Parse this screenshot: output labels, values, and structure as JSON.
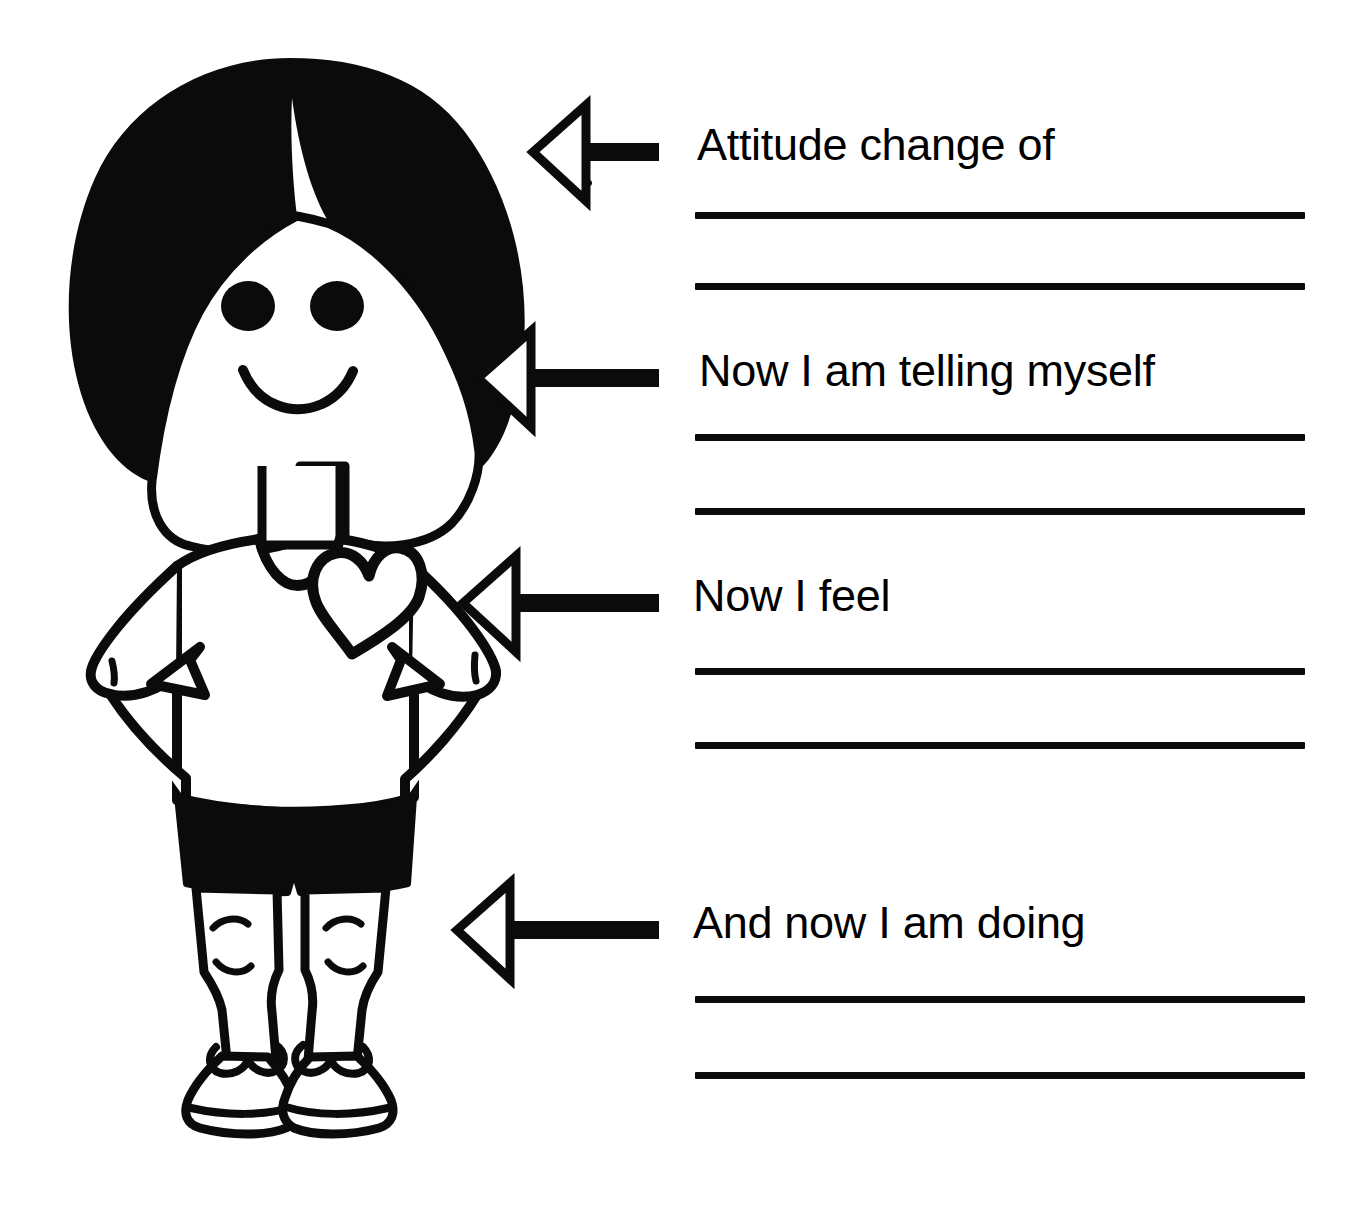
{
  "worksheet": {
    "title": "Attitude change worksheet",
    "background_color": "#ffffff",
    "ink_color": "#000000",
    "illustration": {
      "name": "cartoon-child-figure",
      "description": "Black and white line drawing of a smiling child with bobbed black hair, hands on hips, white t-shirt with an outlined heart, black shorts, bare legs and sneakers",
      "parts": [
        "hair",
        "face",
        "left-eye",
        "right-eye",
        "smile",
        "neck",
        "tshirt",
        "heart",
        "left-arm",
        "right-arm",
        "shorts",
        "left-leg",
        "right-leg",
        "left-shoe",
        "right-shoe"
      ]
    },
    "prompts": [
      {
        "id": "attitude-change",
        "label": "Attitude change of",
        "label_x": 697,
        "label_y": 122,
        "arrow": {
          "tip_x": 533,
          "tail_x": 659,
          "y": 152,
          "height": 98
        },
        "lines": [
          {
            "x": 695,
            "y": 212,
            "width": 610
          },
          {
            "x": 695,
            "y": 283,
            "width": 610
          }
        ]
      },
      {
        "id": "now-telling-myself",
        "label": "Now I am telling myself",
        "label_x": 699,
        "label_y": 348,
        "arrow": {
          "tip_x": 478,
          "tail_x": 659,
          "y": 378,
          "height": 98
        },
        "lines": [
          {
            "x": 695,
            "y": 434,
            "width": 610
          },
          {
            "x": 695,
            "y": 508,
            "width": 610
          }
        ]
      },
      {
        "id": "now-i-feel",
        "label": "Now I feel",
        "label_x": 693,
        "label_y": 573,
        "arrow": {
          "tip_x": 463,
          "tail_x": 659,
          "y": 603,
          "height": 98
        },
        "lines": [
          {
            "x": 695,
            "y": 668,
            "width": 610
          },
          {
            "x": 695,
            "y": 742,
            "width": 610
          }
        ]
      },
      {
        "id": "and-now-doing",
        "label": "And now I am doing",
        "label_x": 693,
        "label_y": 900,
        "arrow": {
          "tip_x": 457,
          "tail_x": 659,
          "y": 930,
          "height": 98
        },
        "lines": [
          {
            "x": 695,
            "y": 996,
            "width": 610
          },
          {
            "x": 695,
            "y": 1072,
            "width": 610
          }
        ]
      }
    ]
  }
}
